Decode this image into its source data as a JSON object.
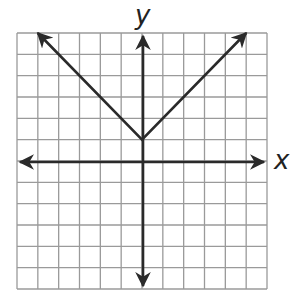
{
  "chart_data": {
    "type": "line",
    "title": "",
    "xlabel": "x",
    "ylabel": "y",
    "xlim": [
      -6,
      6
    ],
    "ylim": [
      -6,
      6
    ],
    "grid": true,
    "grid_step": 1,
    "function": "y = |x| + 1",
    "series": [
      {
        "name": "graph",
        "x": [
          -5,
          0,
          5
        ],
        "y": [
          6,
          1,
          6
        ]
      }
    ],
    "vertex": [
      0,
      1
    ],
    "colors": {
      "line": "#2a2a2a",
      "grid": "#9a9a9a"
    }
  },
  "labels": {
    "x_axis": "x",
    "y_axis": "y"
  }
}
